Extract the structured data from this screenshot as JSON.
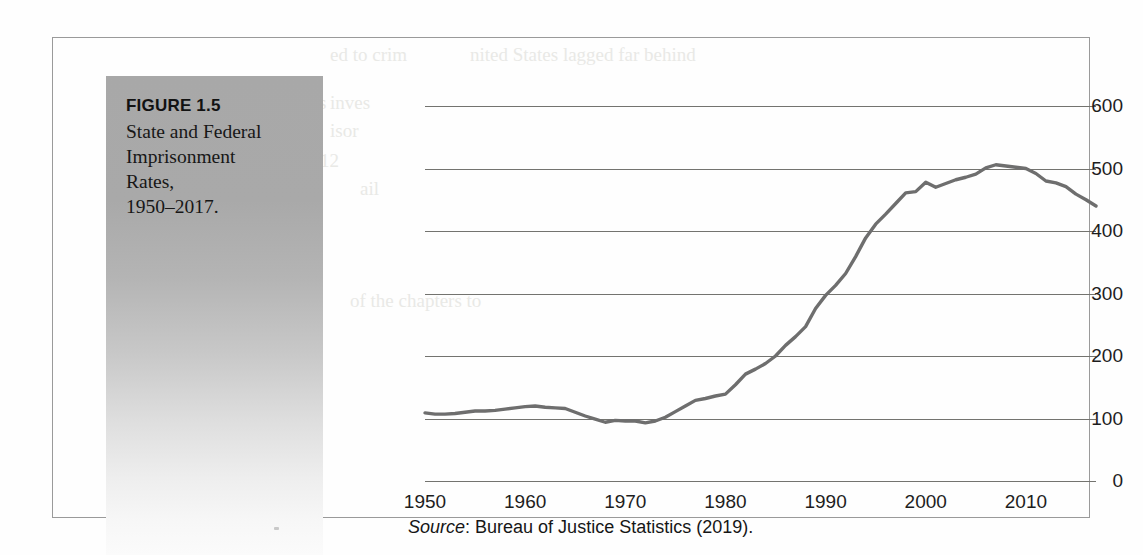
{
  "caption": {
    "figure_number": "FIGURE 1.5",
    "title_lines": [
      "State and Federal",
      "Imprisonment",
      "Rates,",
      "1950–2017."
    ],
    "title_text": "State and Federal Imprisonment Rates, 1950–2017."
  },
  "source": {
    "label": "Source",
    "separator": ": ",
    "text": "Bureau of Justice Statistics (2019).",
    "full": "Source: Bureau of Justice Statistics (2019)."
  },
  "colors": {
    "line": "#6e6e6e",
    "gridline": "#73736f",
    "tick_text": "#1d1d1d",
    "panel_top": "#a8a8a8",
    "panel_bottom": "#fbfbfb",
    "frame_border": "#9a9a9a",
    "page_background": "#fefefe"
  },
  "background_artifacts": [
    {
      "text": "ed to crim",
      "x": 330,
      "y": 44
    },
    {
      "text": "nited States lagged far behind",
      "x": 470,
      "y": 44
    },
    {
      "text": "ons",
      "x": 300,
      "y": 92
    },
    {
      "text": "inves",
      "x": 330,
      "y": 92
    },
    {
      "text": "ers",
      "x": 300,
      "y": 120
    },
    {
      "text": "isor",
      "x": 330,
      "y": 120
    },
    {
      "text": "12",
      "x": 320,
      "y": 150
    },
    {
      "text": "ail",
      "x": 360,
      "y": 178
    },
    {
      "text": "of the chapters to",
      "x": 350,
      "y": 290
    },
    {
      "text": "nd Federal j",
      "x": 190,
      "y": 345
    },
    {
      "text": "Many corrections",
      "x": 150,
      "y": 372
    },
    {
      "text": "us among those",
      "x": 155,
      "y": 400
    },
    {
      "text": "We review the is",
      "x": 150,
      "y": 428
    }
  ],
  "chart_data": {
    "type": "line",
    "xlabel": "",
    "ylabel": "",
    "xlim": [
      1950,
      2017
    ],
    "ylim": [
      0,
      600
    ],
    "grid": true,
    "legend": false,
    "y_ticks": [
      0,
      100,
      200,
      300,
      400,
      500,
      600
    ],
    "y_tick_labels": [
      "0",
      "100",
      "200",
      "300",
      "400",
      "500",
      "600"
    ],
    "x_ticks": [
      1950,
      1960,
      1970,
      1980,
      1990,
      2000,
      2010
    ],
    "x_tick_labels": [
      "1950",
      "1960",
      "1970",
      "1980",
      "1990",
      "2000",
      "2010"
    ],
    "series": [
      {
        "name": "State and Federal imprisonment rate per 100,000",
        "x": [
          1950,
          1951,
          1952,
          1953,
          1954,
          1955,
          1956,
          1957,
          1958,
          1959,
          1960,
          1961,
          1962,
          1963,
          1964,
          1965,
          1966,
          1967,
          1968,
          1969,
          1970,
          1971,
          1972,
          1973,
          1974,
          1975,
          1976,
          1977,
          1978,
          1979,
          1980,
          1981,
          1982,
          1983,
          1984,
          1985,
          1986,
          1987,
          1988,
          1989,
          1990,
          1991,
          1992,
          1993,
          1994,
          1995,
          1996,
          1997,
          1998,
          1999,
          2000,
          2001,
          2002,
          2003,
          2004,
          2005,
          2006,
          2007,
          2008,
          2009,
          2010,
          2011,
          2012,
          2013,
          2014,
          2015,
          2016,
          2017
        ],
        "values": [
          109,
          107,
          107,
          108,
          110,
          112,
          112,
          113,
          115,
          117,
          119,
          120,
          118,
          117,
          116,
          110,
          104,
          99,
          94,
          97,
          96,
          96,
          93,
          96,
          102,
          111,
          120,
          129,
          132,
          136,
          139,
          154,
          171,
          179,
          188,
          200,
          217,
          231,
          247,
          276,
          297,
          313,
          332,
          359,
          389,
          411,
          427,
          444,
          461,
          463,
          478,
          470,
          476,
          482,
          486,
          491,
          501,
          506,
          504,
          502,
          500,
          492,
          480,
          477,
          471,
          459,
          450,
          440
        ]
      }
    ],
    "annotations": [],
    "source": "Bureau of Justice Statistics (2019)."
  }
}
